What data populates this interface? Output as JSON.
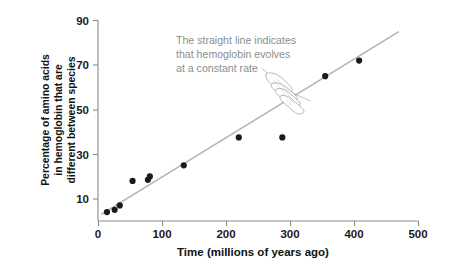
{
  "chart_data": {
    "type": "scatter",
    "title": "",
    "xlabel": "Time (millions of years ago)",
    "ylabel": "Percentage of amino acids in hemoglobin that are different between species",
    "ylabel_lines": [
      "Percentage of amino acids",
      "in hemoglobin that are",
      "different between species"
    ],
    "xlim": [
      0,
      500
    ],
    "ylim": [
      0,
      90
    ],
    "xticks": [
      0,
      100,
      200,
      300,
      400,
      500
    ],
    "yticks": [
      10,
      30,
      50,
      70,
      90
    ],
    "xtick_labels": [
      "0",
      "100",
      "200",
      "300",
      "400",
      "500"
    ],
    "ytick_labels": [
      "10",
      "30",
      "50",
      "70",
      "90"
    ],
    "grid": false,
    "legend": false,
    "points": [
      {
        "x": 14,
        "y": 4
      },
      {
        "x": 26,
        "y": 5
      },
      {
        "x": 34,
        "y": 7
      },
      {
        "x": 54,
        "y": 18
      },
      {
        "x": 78,
        "y": 18.5
      },
      {
        "x": 81,
        "y": 20
      },
      {
        "x": 134,
        "y": 25
      },
      {
        "x": 220,
        "y": 37.5
      },
      {
        "x": 288,
        "y": 37.5
      },
      {
        "x": 355,
        "y": 65
      },
      {
        "x": 408,
        "y": 72
      }
    ],
    "series": [
      {
        "name": "Trend line",
        "type": "line",
        "x": [
          5,
          470
        ],
        "values": [
          3,
          85
        ]
      }
    ],
    "annotations": [
      {
        "name": "straight-line-note",
        "lines": [
          "The straight line indicates",
          "that hemoglobin evolves",
          "at a constant rate"
        ],
        "x": 160,
        "y": 48,
        "points_to": {
          "x": 290,
          "y": 105
        }
      }
    ],
    "colors": {
      "point": "#1a1a1a",
      "trend_line": "#b3b3b3",
      "axis": "#8b8b8b",
      "annotation_text": "#8d8d8d",
      "tick_label": "#1b1b1b",
      "background": "#ffffff"
    }
  }
}
